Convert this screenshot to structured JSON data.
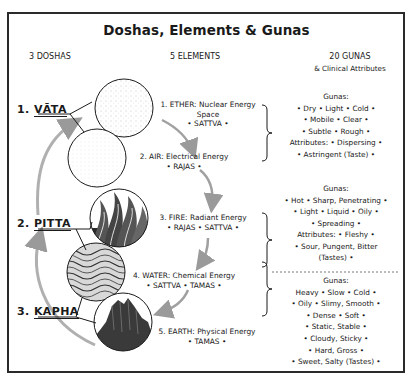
{
  "title": "Doshas, Elements & Gunas",
  "columns": {
    "doshas": "3 DOSHAS",
    "elements": "5 ELEMENTS",
    "gunas": "20 GUNAS",
    "gunas_sub": "& Clinical Attributes"
  },
  "doshas": [
    {
      "num": "1.",
      "name": "VĀTA"
    },
    {
      "num": "2.",
      "name": "PITTA"
    },
    {
      "num": "3.",
      "name": "KAPHA"
    }
  ],
  "elements": [
    {
      "line1": "1. ETHER: Nuclear Energy",
      "line2": "Space",
      "line3": "• SATTVA •",
      "texture": "dotted-space"
    },
    {
      "line1": "2. AIR: Electrical Energy",
      "line2": "• RAJAS •",
      "texture": "faint-air"
    },
    {
      "line1": "3. FIRE: Radiant Energy",
      "line2": "• RAJAS • SATTVA •",
      "texture": "flames"
    },
    {
      "line1": "4. WATER: Chemical Energy",
      "line2": "• SATTVA • TAMAS •",
      "texture": "waves"
    },
    {
      "line1": "5. EARTH: Physical Energy",
      "line2": "• TAMAS •",
      "texture": "mountain"
    }
  ],
  "gunas": {
    "vata": [
      "Gunas:",
      "• Dry • Light • Cold •",
      "• Mobile • Clear •",
      "• Subtle • Rough •",
      "Attributes: • Dispersing •",
      "• Astringent (Taste) •"
    ],
    "pitta": [
      "Gunas:",
      "• Hot • Sharp, Penetrating •",
      "• Light • Liquid • Oily •",
      "• Spreading •",
      "Attributes: • Fleshy •",
      "• Sour, Pungent, Bitter",
      "(Tastes) •"
    ],
    "kapha": [
      "Gunas:",
      "Heavy • Slow • Cold •",
      "• Oily • Slimy, Smooth •",
      "• Dense • Soft •",
      "• Static, Stable •",
      "• Cloudy, Sticky •",
      "• Hard, Gross •",
      "• Sweet, Salty (Tastes) •"
    ]
  },
  "colors": {
    "ink": "#1a1a1a",
    "arrow": "#9a9a9a",
    "border": "#2a2a2a"
  }
}
